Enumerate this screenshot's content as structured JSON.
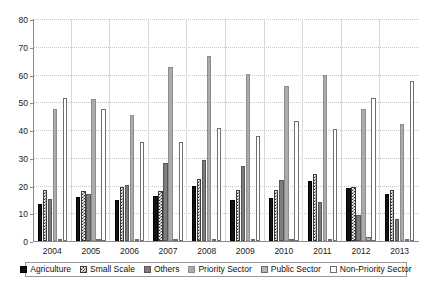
{
  "chart_data": {
    "type": "bar",
    "title": "",
    "subtitle": "",
    "xlabel": "",
    "ylabel": "",
    "ylim": [
      0,
      80
    ],
    "yticks": [
      0,
      10,
      20,
      30,
      40,
      50,
      60,
      70,
      80
    ],
    "grid": true,
    "legend_position": "bottom",
    "categories": [
      "2004",
      "2005",
      "2006",
      "2007",
      "2008",
      "2009",
      "2010",
      "2011",
      "2012",
      "2013"
    ],
    "series": [
      {
        "name": "Agriculture",
        "color": "#121212",
        "values": [
          13.3,
          15.8,
          14.8,
          16.4,
          20.0,
          14.7,
          15.5,
          21.5,
          19.2,
          16.8
        ]
      },
      {
        "name": "Small Scale",
        "color": "#2e2e2e",
        "values": [
          18.5,
          18.2,
          19.4,
          18.1,
          22.2,
          18.5,
          18.3,
          24.1,
          19.3,
          18.5
        ]
      },
      {
        "name": "Others",
        "color": "#7d7d7d",
        "values": [
          15.3,
          17.1,
          20.2,
          28.2,
          29.1,
          27.1,
          22.1,
          14.1,
          9.2,
          7.9
        ]
      },
      {
        "name": "Priority Sector",
        "color": "#ababab",
        "values": [
          47.6,
          51.2,
          45.5,
          62.8,
          66.7,
          60.1,
          55.8,
          59.9,
          47.6,
          42.2
        ]
      },
      {
        "name": "Public Sector",
        "color": "#7a7a7a",
        "values": [
          0.6,
          0.5,
          0.5,
          0.6,
          0.7,
          0.8,
          0.6,
          0.5,
          1.4,
          0.5
        ]
      },
      {
        "name": "Non-Priority Sector",
        "color": "#ffffff",
        "values": [
          51.5,
          47.5,
          35.8,
          35.8,
          40.6,
          37.7,
          43.1,
          40.2,
          51.5,
          57.6
        ]
      }
    ]
  },
  "legend": {
    "items": [
      {
        "label": "Agriculture"
      },
      {
        "label": "Small Scale"
      },
      {
        "label": "Others"
      },
      {
        "label": "Priority Sector"
      },
      {
        "label": "Public Sector"
      },
      {
        "label": "Non-Priority Sector"
      }
    ]
  }
}
